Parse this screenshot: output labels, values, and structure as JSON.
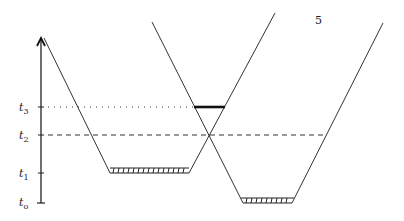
{
  "page_number": "5",
  "axis": {
    "labels": [
      {
        "id": "t3",
        "base": "t",
        "sub": "3",
        "y": 107
      },
      {
        "id": "t2",
        "base": "t",
        "sub": "2",
        "y": 135
      },
      {
        "id": "t1",
        "base": "t",
        "sub": "1",
        "y": 173
      },
      {
        "id": "t0",
        "base": "t",
        "sub": "o",
        "y": 203
      }
    ]
  },
  "colors": {
    "line": "#333333",
    "thick": "#111111"
  }
}
